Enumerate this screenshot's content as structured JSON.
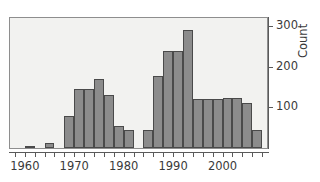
{
  "chart_data": {
    "type": "bar",
    "title": "",
    "subtitle": "",
    "xlabel": "",
    "ylabel": "Count",
    "grid": false,
    "legend": null,
    "bin_width_years": 2,
    "xlim": [
      1957,
      2009
    ],
    "ylim": [
      0,
      320
    ],
    "x_ticks_major": [
      1960,
      1970,
      1980,
      1990,
      2000
    ],
    "x_tick_labels": [
      "1960",
      "1970",
      "1980",
      "1990",
      "2000"
    ],
    "x_ticks_minor": [
      1958,
      1962,
      1964,
      1966,
      1968,
      1972,
      1974,
      1976,
      1978,
      1982,
      1984,
      1986,
      1988,
      1992,
      1994,
      1996,
      1998,
      2002,
      2004,
      2006,
      2008
    ],
    "y_ticks": [
      100,
      200,
      300
    ],
    "y_tick_labels": [
      "100",
      "200",
      "300"
    ],
    "bar_color": "#8c8c8c",
    "bar_edge_color": "#4a4a4a",
    "panel_color": "#f2f2f0",
    "categories": [
      "1958",
      "1960",
      "1962",
      "1964",
      "1966",
      "1968",
      "1970",
      "1972",
      "1974",
      "1976",
      "1978",
      "1980",
      "1982",
      "1984",
      "1986",
      "1988",
      "1990",
      "1992",
      "1994",
      "1996",
      "1998",
      "2000",
      "2002",
      "2004",
      "2006"
    ],
    "values": [
      0,
      5,
      0,
      12,
      0,
      80,
      145,
      145,
      170,
      130,
      55,
      45,
      0,
      45,
      178,
      240,
      240,
      290,
      120,
      120,
      120,
      122,
      122,
      110,
      45
    ]
  }
}
